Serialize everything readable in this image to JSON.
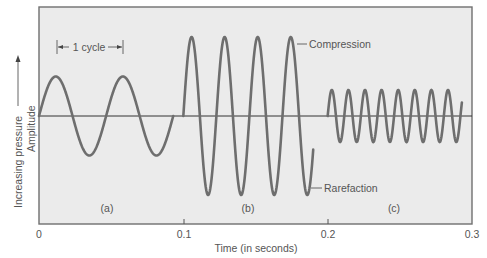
{
  "chart_data": {
    "type": "line",
    "title": "",
    "xlabel": "Time (in seconds)",
    "ylabel": "Amplitude",
    "ylabel_secondary": "Increasing pressure",
    "xlim": [
      0,
      0.3
    ],
    "xticks": [
      "0",
      "0.1",
      "0.2",
      "0.3"
    ],
    "grid": false,
    "baseline": 0,
    "series": [
      {
        "name": "(a)",
        "t_start": 0.0,
        "t_end": 0.093,
        "period_s": 0.0465,
        "amplitude": 0.5,
        "cycles_shown": 2,
        "description": "low frequency, medium amplitude"
      },
      {
        "name": "(b)",
        "t_start": 0.1,
        "t_end": 0.19,
        "period_s": 0.0229,
        "amplitude": 1.0,
        "cycles_shown": 4,
        "description": "higher frequency, large amplitude"
      },
      {
        "name": "(c)",
        "t_start": 0.2,
        "t_end": 0.293,
        "period_s": 0.0115,
        "amplitude": 0.33,
        "cycles_shown": 8,
        "description": "highest frequency, small amplitude"
      }
    ],
    "annotations": [
      {
        "text": "1 cycle",
        "type": "bracket",
        "series": "(a)"
      },
      {
        "text": "Compression",
        "type": "pointer",
        "target": "peak of (b)"
      },
      {
        "text": "Rarefaction",
        "type": "pointer",
        "target": "trough of (b)"
      }
    ]
  },
  "labels": {
    "xlabel": "Time (in seconds)",
    "ylabel_pressure": "Increasing pressure",
    "ylabel_amplitude": "Amplitude",
    "ticks": [
      "0",
      "0.1",
      "0.2",
      "0.3"
    ],
    "panel_a": "(a)",
    "panel_b": "(b)",
    "panel_c": "(c)",
    "cycle": "1 cycle",
    "compression": "Compression",
    "rarefaction": "Rarefaction"
  },
  "colors": {
    "plot_background": "#ebebeb",
    "wave": "#6e6e6e",
    "text": "#555555"
  }
}
